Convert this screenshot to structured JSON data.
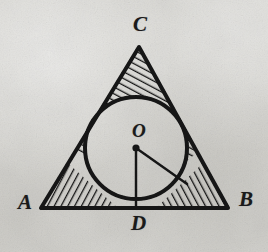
{
  "figure": {
    "kind": "geometry-diagram",
    "background_color": "#d7d6d1",
    "ink_color": "#141414",
    "labels": [
      {
        "id": "A",
        "text": "A",
        "role": "vertex-label-left",
        "x": 18,
        "y": 192
      },
      {
        "id": "B",
        "text": "B",
        "role": "vertex-label-right",
        "x": 239,
        "y": 189
      },
      {
        "id": "C",
        "text": "C",
        "role": "vertex-label-apex",
        "x": 133,
        "y": 14
      },
      {
        "id": "D",
        "text": "D",
        "role": "tangent-point-label-base",
        "x": 131,
        "y": 213
      },
      {
        "id": "O",
        "text": "O",
        "role": "circle-center-label",
        "x": 132,
        "y": 121
      }
    ],
    "triangle": {
      "vertex_a": {
        "x": 41,
        "y": 208
      },
      "vertex_b": {
        "x": 228,
        "y": 208
      },
      "vertex_c": {
        "x": 139,
        "y": 47
      },
      "stroke_width": 4
    },
    "incircle": {
      "center": {
        "x": 136,
        "y": 148
      },
      "radius": 51,
      "stroke_width": 4
    },
    "radius_to_base": {
      "from": {
        "x": 136,
        "y": 148
      },
      "to": {
        "x": 136,
        "y": 206
      },
      "stroke_width": 2.4
    },
    "radius_to_side": {
      "from": {
        "x": 136,
        "y": 148
      },
      "to": {
        "x": 187,
        "y": 184
      },
      "stroke_width": 2.4
    },
    "center_dot": {
      "x": 136,
      "y": 148,
      "radius": 3.6
    },
    "hatching": {
      "style": "parallel-line-shading",
      "regions": [
        "apex-corner",
        "left-corner",
        "right-corner"
      ],
      "line_width": 2.6,
      "spacing": 6
    }
  }
}
